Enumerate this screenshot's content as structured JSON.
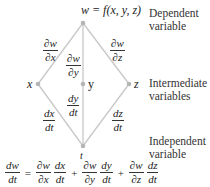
{
  "nodes": {
    "w": {
      "label": "w = f(x, y, z)"
    },
    "x": {
      "label": "x"
    },
    "y": {
      "label": "y"
    },
    "z": {
      "label": "z"
    },
    "t": {
      "label": "t"
    }
  },
  "edges": {
    "w_x": {
      "num": "∂w",
      "den": "∂x"
    },
    "w_y": {
      "num": "∂w",
      "den": "∂y"
    },
    "w_z": {
      "num": "∂w",
      "den": "∂z"
    },
    "x_t": {
      "num": "dx",
      "den": "dt"
    },
    "y_t": {
      "num": "dy",
      "den": "dt"
    },
    "z_t": {
      "num": "dz",
      "den": "dt"
    }
  },
  "levels": {
    "dependent": {
      "line1": "Dependent",
      "line2": "variable"
    },
    "intermediate": {
      "line1": "Intermediate",
      "line2": "variables"
    },
    "independent": {
      "line1": "Independent",
      "line2": "variable"
    }
  },
  "formula": {
    "lhs": {
      "num": "dw",
      "den": "dt"
    },
    "equals": "=",
    "plus": "+",
    "terms": [
      {
        "p_num": "∂w",
        "p_den": "∂x",
        "d_num": "dx",
        "d_den": "dt"
      },
      {
        "p_num": "∂w",
        "p_den": "∂y",
        "d_num": "dy",
        "d_den": "dt"
      },
      {
        "p_num": "∂w",
        "p_den": "∂z",
        "d_num": "dz",
        "d_den": "dt"
      }
    ]
  },
  "colors": {
    "edge": "#c8c8c8",
    "node": "#b5b5b5",
    "text": "#222222"
  }
}
